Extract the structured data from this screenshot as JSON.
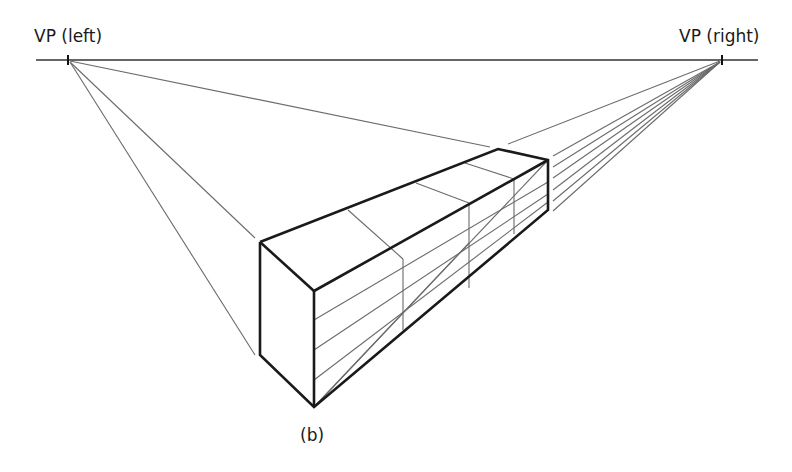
{
  "diagram": {
    "labels": {
      "vp_left": "VP (left)",
      "vp_right": "VP (right)",
      "caption": "(b)"
    },
    "colors": {
      "construction_line": "#6b6b6b",
      "box_edge": "#1a1a1a",
      "background": "#ffffff"
    },
    "points": {
      "vp_left": [
        68,
        60
      ],
      "vp_right": [
        722,
        60
      ]
    }
  }
}
